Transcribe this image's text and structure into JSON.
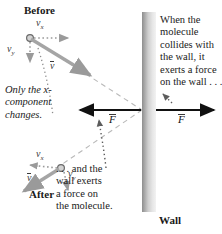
{
  "figure": {
    "title_before": "Before",
    "title_after": "After",
    "wall_label": "Wall",
    "note_left": "Only the x-\ncomponent\nchanges.",
    "note_bottom": ". . . and the\nwall exerts\na force on\nthe molecule.",
    "note_right": "When the\nmolecule\ncollides with\nthe wall, it\nexerts a force\non the wall . . ."
  },
  "vectors": {
    "before": {
      "vx": "v",
      "vx_sub": "x",
      "vy": "v",
      "vy_sub": "y",
      "v": "v"
    },
    "after": {
      "vx": "v",
      "vx_sub": "x",
      "vy": "v",
      "vy_sub": "y",
      "v": "v"
    },
    "force_on_molecule": "F",
    "force_on_wall": "F"
  },
  "colors": {
    "arrow_gray": "#9a9a9a",
    "text_dark": "#1a1a1a",
    "force_black": "#111111",
    "wall_dark": "#8e8e8e",
    "wall_light": "#ededed",
    "dashed_gray": "#b9b9b9",
    "dotted_gray": "#6f6f6f"
  },
  "geometry": {
    "molecule_before": [
      30,
      38
    ],
    "molecule_after": [
      61,
      168
    ],
    "impact_point": [
      143,
      110
    ],
    "wall_x_range": [
      142,
      156
    ],
    "wall_y_range": [
      12,
      212
    ]
  }
}
